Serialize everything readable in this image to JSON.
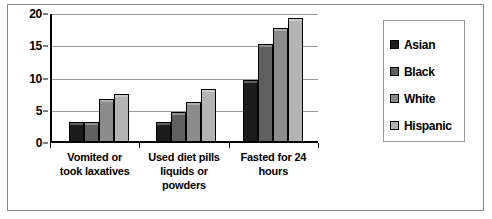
{
  "chart_data": {
    "type": "bar",
    "title": "",
    "xlabel": "",
    "ylabel": "",
    "ylim": [
      0,
      20
    ],
    "yticks": [
      0,
      5,
      10,
      15,
      20
    ],
    "grid": true,
    "legend_position": "right",
    "categories": [
      "Vomited or took laxatives",
      "Used diet pills liquids or powders",
      "Fasted for 24 hours"
    ],
    "series": [
      {
        "name": "Asian",
        "color": "#1c1c1c",
        "values": [
          3,
          3,
          9.5
        ]
      },
      {
        "name": "Black",
        "color": "#606060",
        "values": [
          3,
          4.5,
          15
        ]
      },
      {
        "name": "White",
        "color": "#8c8c8c",
        "values": [
          6.5,
          6,
          17.5
        ]
      },
      {
        "name": "Hispanic",
        "color": "#b4b4b4",
        "values": [
          7.3,
          8,
          19
        ]
      }
    ]
  },
  "axis": {
    "tick_0": "0",
    "tick_5": "5",
    "tick_10": "10",
    "tick_15": "15",
    "tick_20": "20"
  },
  "categories": {
    "c0_line1": "Vomited or",
    "c0_line2": "took laxatives",
    "c1_line1": "Used diet pills",
    "c1_line2": "liquids or",
    "c1_line3": "powders",
    "c2_line1": "Fasted for 24",
    "c2_line2": "hours"
  },
  "legend": {
    "items": [
      {
        "label": "Asian"
      },
      {
        "label": "Black"
      },
      {
        "label": "White"
      },
      {
        "label": "Hispanic"
      }
    ]
  }
}
